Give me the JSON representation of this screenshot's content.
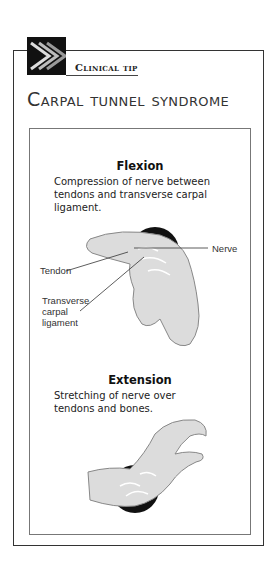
{
  "header": {
    "badge_label": "Clinical tip",
    "title": "Carpal tunnel syndrome"
  },
  "sections": [
    {
      "title": "Flexion",
      "description": "Compression of nerve between tendons and transverse carpal ligament.",
      "labels": {
        "tendon": "Tendon",
        "nerve": "Nerve",
        "ligament_line1": "Transverse",
        "ligament_line2": "carpal",
        "ligament_line3": "ligament"
      }
    },
    {
      "title": "Extension",
      "description": "Stretching of nerve over tendons and bones."
    }
  ]
}
